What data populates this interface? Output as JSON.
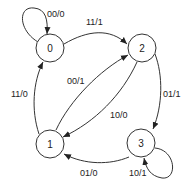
{
  "diagram": {
    "type": "state-machine",
    "states": [
      {
        "id": "0",
        "label": "0"
      },
      {
        "id": "1",
        "label": "1"
      },
      {
        "id": "2",
        "label": "2"
      },
      {
        "id": "3",
        "label": "3"
      }
    ],
    "transitions": [
      {
        "from": "0",
        "to": "0",
        "label": "00/0"
      },
      {
        "from": "0",
        "to": "2",
        "label": "11/1"
      },
      {
        "from": "1",
        "to": "0",
        "label": "11/0"
      },
      {
        "from": "1",
        "to": "2",
        "label": "00/1"
      },
      {
        "from": "2",
        "to": "1",
        "label": "10/0"
      },
      {
        "from": "2",
        "to": "3",
        "label": "01/1"
      },
      {
        "from": "3",
        "to": "1",
        "label": "01/0"
      },
      {
        "from": "3",
        "to": "3",
        "label": "10/1"
      }
    ]
  }
}
